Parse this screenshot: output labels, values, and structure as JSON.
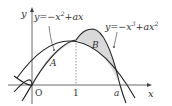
{
  "diagram": {
    "type": "function-graph",
    "axes": {
      "x_label": "x",
      "y_label": "y",
      "origin_label": "O"
    },
    "ticks": {
      "one_label": "1",
      "a_label": "a"
    },
    "curves": [
      {
        "id": "parabola",
        "equation": "y=−x²+ax",
        "label_main": "y=−x",
        "label_sup": "2",
        "label_tail": "+ax"
      },
      {
        "id": "cubic",
        "equation": "y=−x³+ax²",
        "label_main": "y=−x",
        "label_sup": "3",
        "label_tail": "+ax",
        "label_sup2": "2"
      }
    ],
    "regions": [
      {
        "id": "A",
        "label": "A",
        "between": "x=0 and x=1"
      },
      {
        "id": "B",
        "label": "B",
        "between": "x=1 and x=a"
      }
    ],
    "colors": {
      "curve": "#222222",
      "axis": "#444444",
      "fill": "#d9d9d9",
      "dotted": "#666666"
    }
  }
}
